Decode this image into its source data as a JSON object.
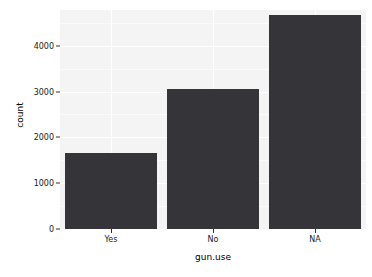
{
  "chart_data": {
    "type": "bar",
    "title": "",
    "subtitle": "",
    "xlabel": "gun.use",
    "ylabel": "count",
    "categories": [
      "Yes",
      "No",
      "NA"
    ],
    "values": [
      1650,
      3060,
      4665
    ],
    "series": [
      {
        "name": "count",
        "values": [
          1650,
          3060,
          4665
        ]
      }
    ],
    "ylim": [
      0,
      4780
    ],
    "xlim": [
      0,
      3
    ],
    "y_ticks": [
      0,
      1000,
      2000,
      3000,
      4000
    ],
    "y_tick_labels": [
      "0",
      "1000",
      "2000",
      "3000",
      "4000"
    ],
    "y_minor_ticks": [
      500,
      1500,
      2500,
      3500,
      4500
    ],
    "x_ticks": [
      "Yes",
      "No",
      "NA"
    ],
    "grid": true,
    "legend": null,
    "legend_position": "none",
    "annotations": [],
    "bar_color": "#353539",
    "panel_background": "#f4f4f4",
    "gridline_color": "#ffffff",
    "plot_background": "#ffffff",
    "axis_text_color": "#1a1a1a",
    "axis_title_color": "#000000"
  }
}
